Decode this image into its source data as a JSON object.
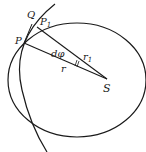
{
  "diagram": {
    "labels": {
      "Q": "Q",
      "P1": "P",
      "P1_sub": "1",
      "P": "P",
      "dphi": "dφ",
      "r1": "r",
      "r1_sub": "1",
      "r": "r",
      "S": "S"
    },
    "colors": {
      "stroke": "#1a1a1a",
      "background": "#ffffff"
    }
  }
}
